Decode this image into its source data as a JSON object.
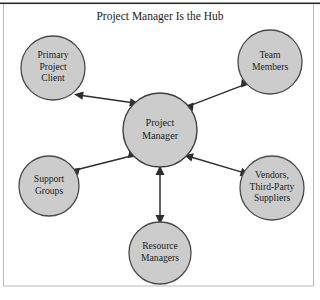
{
  "figure": {
    "title": "Project Manager Is the Hub",
    "colors": {
      "node_fill": "#cccccc",
      "node_stroke": "#4a4a4a",
      "connector": "#2e2e2e",
      "text": "#1c1c1c",
      "rule": "#2b2b2b",
      "frame": "#b9b9b9"
    }
  },
  "hub": {
    "id": "project-manager",
    "lines": [
      "Project",
      "Manager"
    ],
    "cx": 160,
    "cy": 130,
    "r": 37
  },
  "nodes": [
    {
      "id": "primary-project-client",
      "lines": [
        "Primary",
        "Project",
        "Client"
      ],
      "cx": 53,
      "cy": 68,
      "r": 32
    },
    {
      "id": "team-members",
      "lines": [
        "Team",
        "Members"
      ],
      "cx": 270,
      "cy": 62,
      "r": 32
    },
    {
      "id": "support-groups",
      "lines": [
        "Support",
        "Groups"
      ],
      "cx": 49,
      "cy": 186,
      "r": 30
    },
    {
      "id": "vendors-third-party-suppliers",
      "lines": [
        "Vendors,",
        "Third-Party",
        "Suppliers"
      ],
      "cx": 272,
      "cy": 188,
      "r": 32
    },
    {
      "id": "resource-managers",
      "lines": [
        "Resource",
        "Managers"
      ],
      "cx": 160,
      "cy": 253,
      "r": 31
    }
  ],
  "connections": [
    {
      "id": "hub-to-primary-project-client",
      "from": "project-manager",
      "to": "primary-project-client",
      "style": "double-arrow"
    },
    {
      "id": "hub-to-team-members",
      "from": "project-manager",
      "to": "team-members",
      "style": "double-arrow"
    },
    {
      "id": "hub-to-support-groups",
      "from": "project-manager",
      "to": "support-groups",
      "style": "double-arrow"
    },
    {
      "id": "hub-to-vendors",
      "from": "project-manager",
      "to": "vendors-third-party-suppliers",
      "style": "double-arrow"
    },
    {
      "id": "hub-to-resource-managers",
      "from": "project-manager",
      "to": "resource-managers",
      "style": "double-arrow"
    }
  ]
}
